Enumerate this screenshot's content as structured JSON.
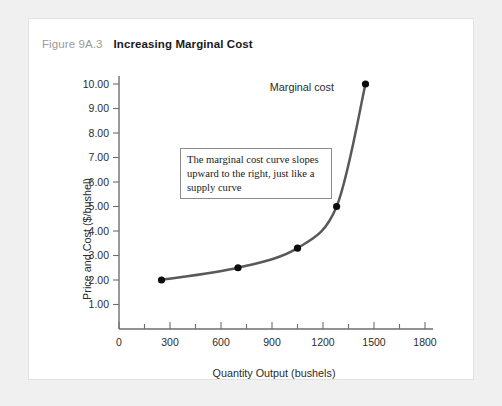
{
  "figure": {
    "number": "Figure 9A.3",
    "title": "Increasing Marginal Cost"
  },
  "annotation": {
    "text": "The marginal cost curve slopes upward to the right, just like a supply curve"
  },
  "chart_data": {
    "type": "line",
    "title": "Increasing Marginal Cost",
    "xlabel": "Quantity Output (bushels)",
    "ylabel": "Price and Cost ($/bushel)",
    "xlim": [
      0,
      1800
    ],
    "ylim": [
      0,
      10
    ],
    "grid": false,
    "legend_position": "inline-label",
    "x_ticks": [
      0,
      300,
      600,
      900,
      1200,
      1500,
      1800
    ],
    "x_tick_labels": [
      "0",
      "300",
      "600",
      "900",
      "1200",
      "1500",
      "1800"
    ],
    "x_minor_ticks": [
      150,
      450,
      750,
      1050,
      1350,
      1650
    ],
    "y_ticks": [
      1,
      2,
      3,
      4,
      5,
      6,
      7,
      8,
      9,
      10
    ],
    "y_tick_labels": [
      "1.00",
      "2.00",
      "3.00",
      "4.00",
      "5.00",
      "6.00",
      "7.00",
      "8.00",
      "9.00",
      "10.00"
    ],
    "series": [
      {
        "name": "Marginal cost",
        "color": "#595959",
        "marker_color": "#0d0d0d",
        "x": [
          250,
          700,
          1050,
          1280,
          1450
        ],
        "values": [
          2.0,
          2.5,
          3.3,
          5.0,
          10.0
        ]
      }
    ],
    "annotations": [
      {
        "name": "series-label",
        "text": "Marginal cost",
        "x": 1130,
        "y": 9.35
      },
      {
        "name": "callout-box",
        "text": "The marginal cost curve slopes upward to the right, just like a supply curve"
      }
    ]
  }
}
